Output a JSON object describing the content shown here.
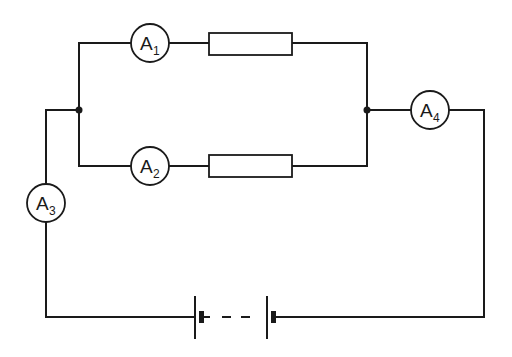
{
  "diagram": {
    "type": "circuit",
    "colors": {
      "line": "#1a1a1a",
      "background": "#ffffff"
    },
    "ammeters": [
      {
        "id": "A1",
        "letter": "A",
        "subscript": "1",
        "location": "top parallel branch"
      },
      {
        "id": "A2",
        "letter": "A",
        "subscript": "2",
        "location": "bottom parallel branch"
      },
      {
        "id": "A3",
        "letter": "A",
        "subscript": "3",
        "location": "main line, left side"
      },
      {
        "id": "A4",
        "letter": "A",
        "subscript": "4",
        "location": "main line, right side"
      }
    ],
    "resistors": [
      {
        "id": "R1",
        "location": "top parallel branch"
      },
      {
        "id": "R2",
        "location": "bottom parallel branch"
      }
    ],
    "junctions": [
      {
        "id": "left-junction"
      },
      {
        "id": "right-junction"
      }
    ],
    "battery": {
      "cells": 2,
      "connection": "dashed link between cells"
    }
  }
}
